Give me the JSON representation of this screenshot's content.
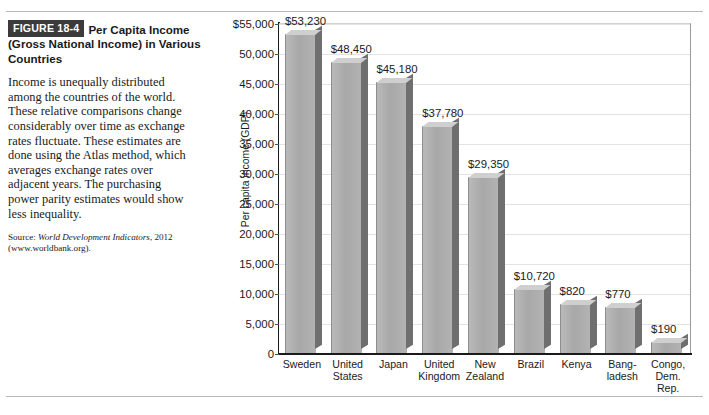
{
  "figure": {
    "badge": "FIGURE 18-4",
    "title": "Per Capita Income (Gross National Income) in Various Countries",
    "body": "Income is unequally distributed among the countries of the world. These relative comparisons change considerably over time as exchange rates fluctuate. These estimates are done using the Atlas method, which averages exchange rates over adjacent years. The purchasing power parity estimates would show less inequality.",
    "source_prefix": "Source: ",
    "source_italic": "World Development Indicators",
    "source_suffix": ", 2012 (www.worldbank.org)."
  },
  "chart_data": {
    "type": "bar",
    "title": "Per Capita Income (Gross National Income) in Various Countries",
    "xlabel": "",
    "ylabel": "Per capita income (GDP)",
    "ylim": [
      0,
      55000
    ],
    "ytick_labels": [
      "$55,000",
      "50,000",
      "45,000",
      "40,000",
      "35,000",
      "30,000",
      "25,000",
      "20,000",
      "15,000",
      "10,000",
      "5,000",
      "0"
    ],
    "ytick_values": [
      55000,
      50000,
      45000,
      40000,
      35000,
      30000,
      25000,
      20000,
      15000,
      10000,
      5000,
      0
    ],
    "grid": true,
    "legend": "none",
    "categories": [
      "Sweden",
      "United States",
      "Japan",
      "United Kingdom",
      "New Zealand",
      "Brazil",
      "Kenya",
      "Bangladesh",
      "Congo, Dem. Rep."
    ],
    "category_lines": [
      [
        "Sweden"
      ],
      [
        "United",
        "States"
      ],
      [
        "Japan"
      ],
      [
        "United",
        "Kingdom"
      ],
      [
        "New",
        "Zealand"
      ],
      [
        "Brazil"
      ],
      [
        "Kenya"
      ],
      [
        "Bang-",
        "ladesh"
      ],
      [
        "Congo,",
        "Dem.",
        "Rep."
      ]
    ],
    "values": [
      53230,
      48450,
      45180,
      37780,
      29350,
      10720,
      820,
      770,
      190
    ],
    "value_labels": [
      "$53,230",
      "$48,450",
      "$45,180",
      "$37,780",
      "$29,350",
      "$10,720",
      "$820",
      "$770",
      "$190"
    ],
    "drawn_heights": [
      53230,
      48450,
      45180,
      37780,
      29350,
      10720,
      8200,
      7700,
      1900
    ],
    "colors": {
      "bar_front": "#b0b0b0",
      "bar_top": "#cfcfcf",
      "bar_side": "#6f6f6f",
      "gridline": "#e3e3e3",
      "axis": "#1a1a1a",
      "badge_bg": "#3b3b3b",
      "badge_text": "#ffffff"
    }
  }
}
